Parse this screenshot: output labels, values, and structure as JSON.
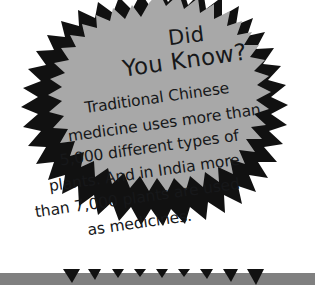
{
  "graphic": {
    "type": "starburst-callout",
    "shape_name": "jagged-starburst",
    "fill_color": "#a8a8a8",
    "outline_color": "#111111",
    "background_color": "#ffffff",
    "bottom_bar_color": "#808080"
  },
  "callout": {
    "heading": {
      "line1": "Did",
      "line2": "You Know?"
    },
    "body_lines": [
      "Traditional Chinese",
      "medicine uses more than",
      "5,000 different types of",
      "plants. And in India more",
      "than 7,000 plants are used",
      "as medicines."
    ],
    "body_text": "Traditional Chinese medicine uses more than 5,000 different types of plants. And in India more than 7,000 plants are used as medicines."
  },
  "facts": {
    "chinese_medicine_plant_types": "5,000",
    "india_medicinal_plants": "7,000"
  }
}
